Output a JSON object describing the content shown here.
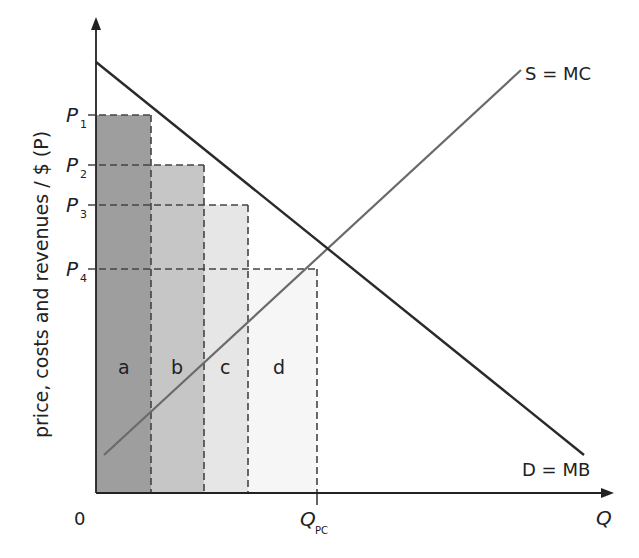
{
  "diagram": {
    "type": "supply-demand",
    "axes": {
      "y_label": "price, costs and revenues / $ (P)",
      "x_label": "Q",
      "origin": "0"
    },
    "price_levels": [
      {
        "main": "P",
        "sub": "1"
      },
      {
        "main": "P",
        "sub": "2"
      },
      {
        "main": "P",
        "sub": "3"
      },
      {
        "main": "P",
        "sub": "4"
      }
    ],
    "quantity_marker": {
      "main": "Q",
      "sub": "PC"
    },
    "curves": {
      "supply": "S = MC",
      "demand": "D = MB"
    },
    "regions": [
      {
        "label": "a",
        "color": "#9e9e9e"
      },
      {
        "label": "b",
        "color": "#c4c4c4"
      },
      {
        "label": "c",
        "color": "#e6e6e6"
      },
      {
        "label": "d",
        "color": "#f5f5f5"
      }
    ],
    "colors": {
      "demand_line": "#2a2a2a",
      "supply_line": "#6a6a6a",
      "axes": "#222222",
      "dashes": "#444444"
    }
  }
}
